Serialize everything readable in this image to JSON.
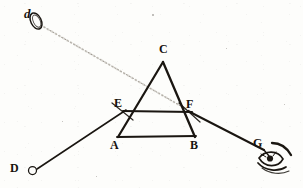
{
  "figure": {
    "ink_color": "#1a1611",
    "paper_color": "#fdfdfb",
    "ray_dotted_color": "#8d8madd",
    "width": 303,
    "height": 188
  },
  "labels": {
    "source": "d",
    "apex": "C",
    "left_face": "E",
    "right_face": "F",
    "base_left": "A",
    "base_right": "B",
    "eye": "G",
    "object": "D"
  },
  "points": {
    "d": {
      "x": 33,
      "y": 17,
      "label": "d"
    },
    "C": {
      "x": 163,
      "y": 62,
      "label": "C"
    },
    "E": {
      "x": 125,
      "y": 111,
      "label": "E"
    },
    "F": {
      "x": 190,
      "y": 112,
      "label": "F"
    },
    "A": {
      "x": 119,
      "y": 137,
      "label": "A"
    },
    "B": {
      "x": 194,
      "y": 137,
      "label": "B"
    },
    "D": {
      "x": 33,
      "y": 170,
      "label": "D"
    },
    "G": {
      "x": 263,
      "y": 149,
      "label": "G"
    }
  },
  "label_positions": {
    "d": {
      "x": 24,
      "y": 7
    },
    "C": {
      "x": 159,
      "y": 43
    },
    "E": {
      "x": 115,
      "y": 97
    },
    "F": {
      "x": 186,
      "y": 98
    },
    "A": {
      "x": 110,
      "y": 139
    },
    "B": {
      "x": 190,
      "y": 139
    },
    "D": {
      "x": 10,
      "y": 162
    },
    "G": {
      "x": 254,
      "y": 138
    }
  },
  "segments": [
    {
      "name": "prism-left-edge",
      "from": "A",
      "to": "C",
      "style": "solid",
      "weight": 2.1
    },
    {
      "name": "prism-right-edge",
      "from": "C",
      "to": "B",
      "style": "solid",
      "weight": 2.1
    },
    {
      "name": "prism-base",
      "from": "A",
      "to": "B",
      "style": "solid",
      "weight": 1.8
    },
    {
      "name": "chord-EF",
      "from": "E",
      "to": "F",
      "style": "solid",
      "weight": 2.0
    },
    {
      "name": "incident-ray-DE",
      "from": "D",
      "to": "E",
      "style": "solid",
      "weight": 1.5
    },
    {
      "name": "emergent-ray-FG",
      "from": "F",
      "to": "G",
      "style": "solid",
      "weight": 1.9
    },
    {
      "name": "sight-line-dF",
      "from": "d",
      "to": "F",
      "style": "dotted",
      "weight": 1.0
    }
  ],
  "markers": {
    "source_ellipse": {
      "cx": 36,
      "cy": 20,
      "rx": 5.5,
      "ry": 8.5,
      "rotation": -28
    },
    "object_circle": {
      "cx": 33,
      "cy": 170,
      "r": 4
    }
  },
  "eye": {
    "name": "observer-eye",
    "cx": 270,
    "cy": 162,
    "description": "sketched human eye with brow viewing from G"
  }
}
